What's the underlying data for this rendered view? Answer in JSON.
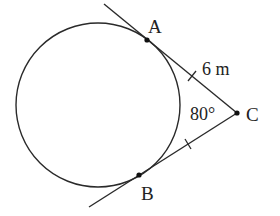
{
  "diagram": {
    "type": "geometry",
    "colors": {
      "stroke": "#2a2a2a",
      "text": "#222222",
      "background": "#ffffff"
    },
    "circle": {
      "cx": 98,
      "cy": 105,
      "r": 82
    },
    "points": {
      "A": {
        "label": "A",
        "x": 147,
        "y": 40
      },
      "B": {
        "label": "B",
        "x": 139,
        "y": 175
      },
      "C": {
        "label": "C",
        "x": 237,
        "y": 113
      }
    },
    "tangent_lines": [
      {
        "name": "CA",
        "from": [
          104,
          4
        ],
        "to": [
          237,
          113
        ]
      },
      {
        "name": "CB",
        "from": [
          89,
          207
        ],
        "to": [
          237,
          113
        ]
      }
    ],
    "annotations": {
      "length_label": "6 m",
      "angle_label": "80°"
    },
    "tick_marks": [
      {
        "segment": "AC",
        "x": 192,
        "y": 76
      },
      {
        "segment": "BC",
        "x": 188,
        "y": 144
      }
    ]
  }
}
